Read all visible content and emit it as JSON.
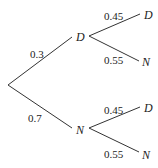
{
  "diagram": {
    "type": "probability-tree",
    "first_stage": [
      {
        "node": "D",
        "probability": "0.3"
      },
      {
        "node": "N",
        "probability": "0.7"
      }
    ],
    "second_stage": {
      "from_D": [
        {
          "node": "D",
          "probability": "0.45"
        },
        {
          "node": "N",
          "probability": "0.55"
        }
      ],
      "from_N": [
        {
          "node": "D",
          "probability": "0.45"
        },
        {
          "node": "N",
          "probability": "0.55"
        }
      ]
    }
  }
}
